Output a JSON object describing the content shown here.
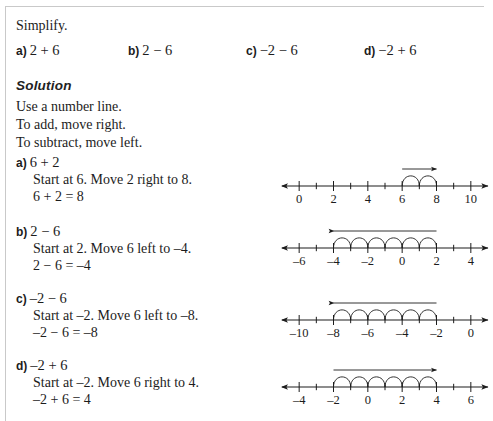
{
  "page": {
    "prompt": "Simplify.",
    "solution_heading": "Solution",
    "intro_lines": [
      "Use a number line.",
      "To add, move right.",
      "To subtract, move left."
    ]
  },
  "problems": [
    {
      "tag": "a)",
      "expression": "2 + 6"
    },
    {
      "tag": "b)",
      "expression": "2 − 6"
    },
    {
      "tag": "c)",
      "expression": "−2 − 6"
    },
    {
      "tag": "d)",
      "expression": "−2 + 6"
    }
  ],
  "steps": [
    {
      "tag": "a)",
      "expression": "6 + 2",
      "instruction": "Start at 6. Move 2 right to 8.",
      "result": "6 + 2 = 8"
    },
    {
      "tag": "b)",
      "expression": "2 − 6",
      "instruction": "Start at 2. Move 6 left to –4.",
      "result": "2 − 6 = –4"
    },
    {
      "tag": "c)",
      "expression": "–2 − 6",
      "instruction": "Start at –2. Move 6 left to –8.",
      "result": "–2 − 6 = –8"
    },
    {
      "tag": "d)",
      "expression": "–2 + 6",
      "instruction": "Start at –2. Move 6 right to 4.",
      "result": "–2 + 6 = 4"
    }
  ],
  "chart_data": [
    {
      "type": "numberline",
      "id": "numberline-a",
      "min": -1,
      "max": 11,
      "tick_step": 1,
      "labeled_ticks": [
        0,
        2,
        4,
        6,
        8,
        10
      ],
      "labels": [
        "0",
        "2",
        "4",
        "6",
        "8",
        "10"
      ],
      "start": 6,
      "end": 8,
      "hops": 2,
      "direction": "right",
      "arrow_from": 6,
      "arrow_to": 8,
      "caption": "6 + 2 = 8"
    },
    {
      "type": "numberline",
      "id": "numberline-b",
      "min": -7,
      "max": 5,
      "tick_step": 1,
      "labeled_ticks": [
        -6,
        -4,
        -2,
        0,
        2,
        4
      ],
      "labels": [
        "–6",
        "–4",
        "–2",
        "0",
        "2",
        "4"
      ],
      "start": 2,
      "end": -4,
      "hops": 6,
      "direction": "left",
      "arrow_from": 2,
      "arrow_to": -4,
      "caption": "2 − 6 = –4"
    },
    {
      "type": "numberline",
      "id": "numberline-c",
      "min": -11,
      "max": 1,
      "tick_step": 1,
      "labeled_ticks": [
        -10,
        -8,
        -6,
        -4,
        -2,
        0
      ],
      "labels": [
        "–10",
        "–8",
        "–6",
        "–4",
        "–2",
        "0"
      ],
      "start": -2,
      "end": -8,
      "hops": 6,
      "direction": "left",
      "arrow_from": -2,
      "arrow_to": -8,
      "caption": "–2 − 6 = –8"
    },
    {
      "type": "numberline",
      "id": "numberline-d",
      "min": -5,
      "max": 7,
      "tick_step": 1,
      "labeled_ticks": [
        -4,
        -2,
        0,
        2,
        4,
        6
      ],
      "labels": [
        "–4",
        "–2",
        "0",
        "2",
        "4",
        "6"
      ],
      "start": -2,
      "end": 4,
      "hops": 6,
      "direction": "right",
      "arrow_from": -2,
      "arrow_to": 4,
      "caption": "–2 + 6 = 4"
    }
  ],
  "colors": {
    "ink": "#1c1c1c",
    "rule": "#c9c9c9",
    "paper": "#ffffff"
  }
}
